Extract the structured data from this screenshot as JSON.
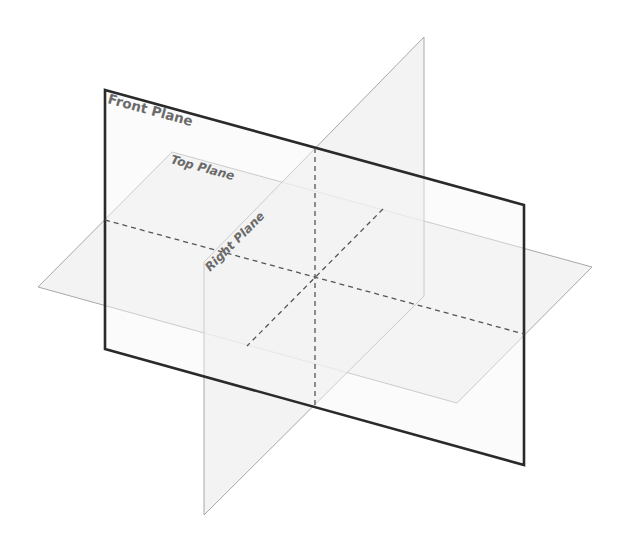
{
  "diagram": {
    "title": "",
    "labels": {
      "front": "Front Plane",
      "top": "Top Plane",
      "right": "Right Plane"
    },
    "colors": {
      "front_edge": "#2a2a2a",
      "plane_edge": "#a8a8a8",
      "dash": "#555555",
      "fill": "#f1f1f1",
      "label": "#6a6a6a"
    }
  }
}
